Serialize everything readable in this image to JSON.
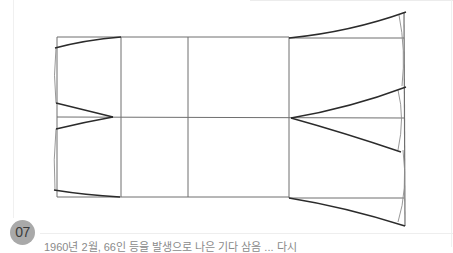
{
  "figure": {
    "number_badge": "07",
    "caption_partial": "1960년 2월, 66인 등을 발생으로 나은 기다 삼음 ... 다시"
  },
  "diagram": {
    "type": "flat sleeve/skirt pattern draft",
    "stroke_color": "#2b2b2b",
    "guide_color": "#6a6a6a",
    "badge_color": "#a9a9a9"
  }
}
